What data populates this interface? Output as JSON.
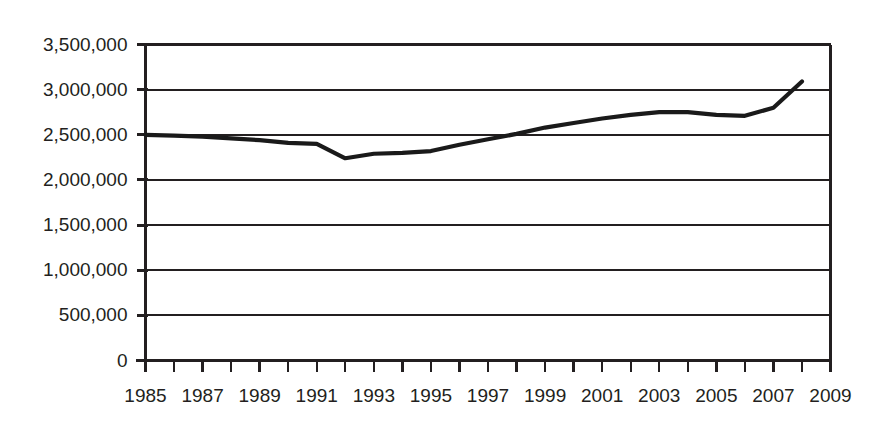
{
  "chart_data": {
    "type": "line",
    "title": "",
    "subtitle": "",
    "xlabel": "",
    "ylabel": "",
    "grid": true,
    "legend": false,
    "legend_position": "none",
    "line_color": "#1a1a1a",
    "axis_color": "#231f20",
    "background_color": "#ffffff",
    "xlim": [
      1985,
      2009
    ],
    "ylim": [
      0,
      3500000
    ],
    "x_tick_interval": 1,
    "x_label_interval": 2,
    "y_tick_interval": 500000,
    "x": [
      1985,
      1986,
      1987,
      1988,
      1989,
      1990,
      1991,
      1992,
      1993,
      1994,
      1995,
      1996,
      1997,
      1998,
      1999,
      2000,
      2001,
      2002,
      2003,
      2004,
      2005,
      2006,
      2007,
      2008
    ],
    "values": [
      2500000,
      2490000,
      2480000,
      2460000,
      2440000,
      2410000,
      2400000,
      2240000,
      2290000,
      2300000,
      2320000,
      2390000,
      2450000,
      2510000,
      2580000,
      2630000,
      2680000,
      2720000,
      2750000,
      2750000,
      2720000,
      2710000,
      2800000,
      3090000
    ],
    "series": [
      {
        "name": "Series 1",
        "values": [
          2500000,
          2490000,
          2480000,
          2460000,
          2440000,
          2410000,
          2400000,
          2240000,
          2290000,
          2300000,
          2320000,
          2390000,
          2450000,
          2510000,
          2580000,
          2630000,
          2680000,
          2720000,
          2750000,
          2750000,
          2720000,
          2710000,
          2800000,
          3090000
        ]
      }
    ],
    "y_tick_labels": [
      "3,500,000",
      "3,000,000",
      "2,500,000",
      "2,000,000",
      "1,500,000",
      "1,000,000",
      "500,000",
      "0"
    ],
    "y_tick_values": [
      3500000,
      3000000,
      2500000,
      2000000,
      1500000,
      1000000,
      500000,
      0
    ],
    "x_tick_labels": [
      "1985",
      "1987",
      "1989",
      "1991",
      "1993",
      "1995",
      "1997",
      "1999",
      "2001",
      "2003",
      "2005",
      "2007",
      "2009"
    ],
    "x_tick_values": [
      1985,
      1987,
      1989,
      1991,
      1993,
      1995,
      1997,
      1999,
      2001,
      2003,
      2005,
      2007,
      2009
    ],
    "x_minor_tick_values": [
      1985,
      1986,
      1987,
      1988,
      1989,
      1990,
      1991,
      1992,
      1993,
      1994,
      1995,
      1996,
      1997,
      1998,
      1999,
      2000,
      2001,
      2002,
      2003,
      2004,
      2005,
      2006,
      2007,
      2008,
      2009
    ],
    "annotations": []
  }
}
